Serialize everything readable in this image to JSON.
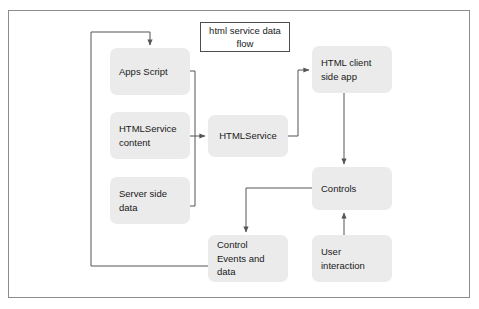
{
  "diagram": {
    "title": "html service data\nflow",
    "frame": {
      "present": true
    },
    "colors": {
      "node_fill": "#ebebeb",
      "node_text": "#1a1a1a",
      "connector": "#555555",
      "frame_border": "#8c8c8c",
      "title_border": "#4d4d4d",
      "background": "#ffffff"
    },
    "nodes": [
      {
        "id": "apps-script",
        "label": "Apps Script",
        "align": "left"
      },
      {
        "id": "htmlservice-content",
        "label": "HTMLService\ncontent",
        "align": "left"
      },
      {
        "id": "server-side-data",
        "label": "Server side\ndata",
        "align": "left"
      },
      {
        "id": "htmlservice",
        "label": "HTMLService",
        "align": "center"
      },
      {
        "id": "html-client",
        "label": "HTML client\nside app",
        "align": "left"
      },
      {
        "id": "controls",
        "label": "Controls",
        "align": "left"
      },
      {
        "id": "control-events",
        "label": "Control\nEvents and\ndata",
        "align": "left"
      },
      {
        "id": "user-interaction",
        "label": "User\ninteraction",
        "align": "left"
      }
    ],
    "edges": [
      {
        "id": "apps-script-to-htmlservice",
        "from": "apps-script",
        "to": "htmlservice",
        "arrow": true
      },
      {
        "id": "htmlservice-content-to-htmlservice",
        "from": "htmlservice-content",
        "to": "htmlservice",
        "arrow": true
      },
      {
        "id": "server-side-data-to-htmlservice",
        "from": "server-side-data",
        "to": "htmlservice",
        "arrow": true
      },
      {
        "id": "htmlservice-to-html-client",
        "from": "htmlservice",
        "to": "html-client",
        "arrow": true
      },
      {
        "id": "html-client-to-controls",
        "from": "html-client",
        "to": "controls",
        "arrow": true
      },
      {
        "id": "user-interaction-to-controls",
        "from": "user-interaction",
        "to": "controls",
        "arrow": true
      },
      {
        "id": "controls-to-control-events",
        "from": "controls",
        "to": "control-events",
        "arrow": true
      },
      {
        "id": "control-events-to-apps-script",
        "from": "control-events",
        "to": "apps-script",
        "arrow": true
      }
    ]
  }
}
